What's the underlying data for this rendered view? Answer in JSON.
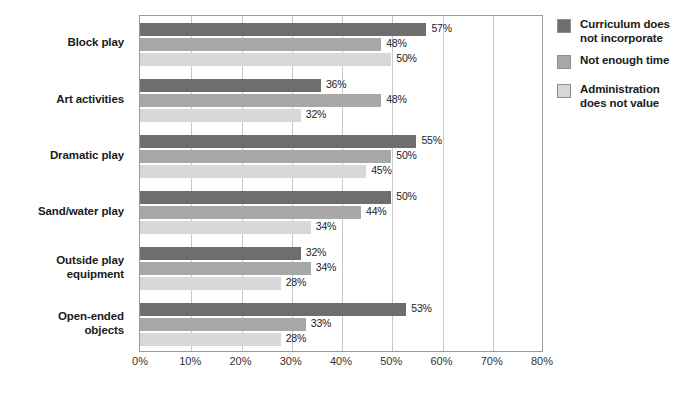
{
  "chart_data": {
    "type": "bar",
    "orientation": "horizontal",
    "title": "",
    "xlabel": "",
    "ylabel": "",
    "xlim": [
      0,
      80
    ],
    "xticks": [
      "0%",
      "10%",
      "20%",
      "30%",
      "40%",
      "50%",
      "60%",
      "70%",
      "80%"
    ],
    "xtick_values": [
      0,
      10,
      20,
      30,
      40,
      50,
      60,
      70,
      80
    ],
    "grid": true,
    "legend_position": "right",
    "categories": [
      "Block play",
      "Art activities",
      "Dramatic play",
      "Sand/water play",
      "Outside play\nequipment",
      "Open-ended\nobjects"
    ],
    "series": [
      {
        "name": "Curriculum does\nnot incorporate",
        "color": "#6e6e6e",
        "values": [
          57,
          36,
          55,
          50,
          32,
          53
        ],
        "labels": [
          "57%",
          "36%",
          "55%",
          "50%",
          "32%",
          "53%"
        ]
      },
      {
        "name": "Not enough time",
        "color": "#a8a8a8",
        "values": [
          48,
          48,
          50,
          44,
          34,
          33
        ],
        "labels": [
          "48%",
          "48%",
          "50%",
          "44%",
          "34%",
          "33%"
        ]
      },
      {
        "name": "Administration\ndoes not value",
        "color": "#d8d8d8",
        "values": [
          50,
          32,
          45,
          34,
          28,
          28
        ],
        "labels": [
          "50%",
          "32%",
          "45%",
          "34%",
          "28%",
          "28%"
        ]
      }
    ]
  },
  "colors": {
    "series_dark": "#6e6e6e",
    "series_medium": "#a8a8a8",
    "series_light": "#d8d8d8",
    "gridline": "#c9c9c9",
    "frame": "#9a9a9a",
    "text": "#1a1a1a",
    "background": "#ffffff"
  }
}
